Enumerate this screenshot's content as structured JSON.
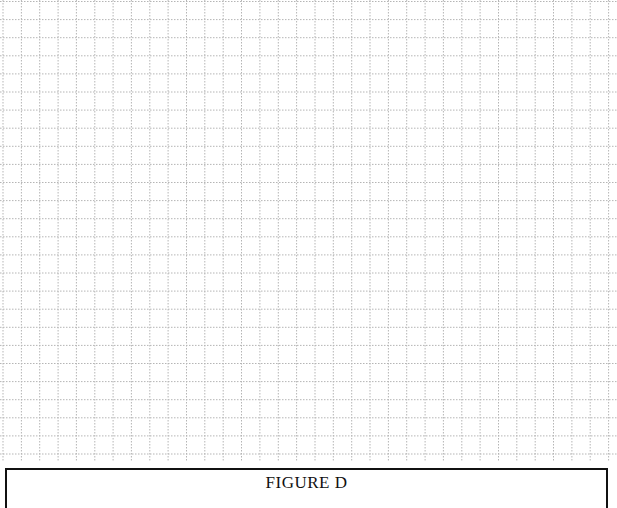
{
  "figure": {
    "caption": "FIGURE D",
    "grid": {
      "cell_width_px": 18.35,
      "cell_height_px": 18.1,
      "line_color": "#b5b5b5",
      "line_style": "dotted",
      "columns": 34,
      "rows": 25
    },
    "frame_color": "#111111"
  }
}
